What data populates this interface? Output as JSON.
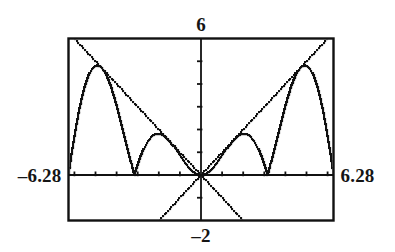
{
  "screen": {
    "kind": "graphing-calculator-plot",
    "background_color": "#ffffff",
    "ink_color": "#111111",
    "frame_color": "#111111"
  },
  "labels": {
    "top": "6",
    "left": "–6.28",
    "right": "6.28",
    "bottom": "–2"
  },
  "chart_data": {
    "type": "line",
    "title": "",
    "subtitle": "",
    "xlabel": "",
    "ylabel": "",
    "xlim": [
      -6.28,
      6.28
    ],
    "ylim": [
      -2,
      6
    ],
    "grid": false,
    "legend": "none",
    "axis_style": "tick-marked crosshair axes inside rectangular viewport frame",
    "x_tick_interval": 1,
    "y_tick_interval": 1,
    "x_ticks": [
      -6,
      -5,
      -4,
      -3,
      -2,
      -1,
      0,
      1,
      2,
      3,
      4,
      5,
      6
    ],
    "y_ticks": [
      -2,
      -1,
      0,
      1,
      2,
      3,
      4,
      5,
      6
    ],
    "tick_labels_shown": false,
    "window_labels": {
      "xmin": "–6.28",
      "xmax": "6.28",
      "ymax": "6",
      "ymin": "–2"
    },
    "series": [
      {
        "name": "y = |x sin x|",
        "expression": "abs(x*sin(x))",
        "style": "dotted",
        "color": "#111111",
        "samples": 260,
        "notes": "oscillating non-negative curve, zeros at x = 0, ±π, ±2π; local maxima near x = ±1.83 (y≈1.78) and x = ±4.82 (y≈4.81)"
      },
      {
        "name": "y = x",
        "expression": "x",
        "style": "dotted",
        "color": "#111111",
        "samples": 160,
        "notes": "upper envelope for x>0, lower diagonal for x<0"
      },
      {
        "name": "y = -x",
        "expression": "-x",
        "style": "dotted",
        "color": "#111111",
        "samples": 160,
        "notes": "upper envelope for x<0, lower diagonal for x>0"
      }
    ],
    "key_points": [
      {
        "x": -6.28,
        "y": 0.0
      },
      {
        "x": -4.82,
        "y": 4.81
      },
      {
        "x": -3.14,
        "y": 0.0
      },
      {
        "x": -1.83,
        "y": 1.78
      },
      {
        "x": 0.0,
        "y": 0.0
      },
      {
        "x": 1.83,
        "y": 1.78
      },
      {
        "x": 3.14,
        "y": 0.0
      },
      {
        "x": 4.82,
        "y": 4.81
      },
      {
        "x": 6.28,
        "y": 0.0
      }
    ]
  }
}
